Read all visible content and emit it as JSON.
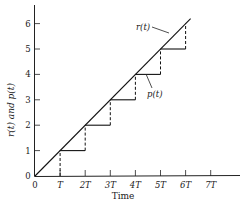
{
  "chart_data": {
    "type": "line",
    "title": "",
    "xlabel": "Time",
    "ylabel": "r(t) and p(t)",
    "x_tick_labels": [
      "0",
      "T",
      "2T",
      "3T",
      "4T",
      "5T",
      "6T",
      "7T"
    ],
    "y_tick_labels": [
      "0",
      "1",
      "2",
      "3",
      "4",
      "5",
      "6"
    ],
    "xlim": [
      0,
      8
    ],
    "ylim": [
      0,
      6.8
    ],
    "grid": false,
    "series": [
      {
        "name": "r(t)",
        "style": "solid ramp",
        "points": [
          [
            0,
            0
          ],
          [
            6.2,
            6.2
          ]
        ]
      },
      {
        "name": "p(t)",
        "style": "staircase (solid holds, dashed jumps)",
        "steps": [
          {
            "from": 0,
            "to": 1,
            "level": 0
          },
          {
            "from": 1,
            "to": 2,
            "level": 1
          },
          {
            "from": 2,
            "to": 3,
            "level": 2
          },
          {
            "from": 3,
            "to": 4,
            "level": 3
          },
          {
            "from": 4,
            "to": 5,
            "level": 4
          },
          {
            "from": 5,
            "to": 6,
            "level": 5
          }
        ]
      }
    ],
    "annotations": [
      {
        "text": "r(t)",
        "points_to": "ramp near t=5.3T"
      },
      {
        "text": "p(t)",
        "points_to": "step at level 4 near t=4.4T"
      }
    ]
  },
  "labels": {
    "x_axis_title": "Time",
    "y_axis_title": "r(t) and p(t)",
    "r_label": "r(t)",
    "p_label": "p(t)"
  }
}
